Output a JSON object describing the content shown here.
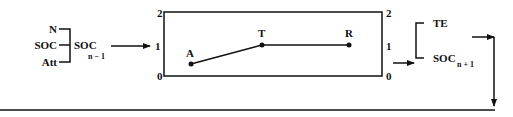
{
  "diagram": {
    "inputs": {
      "items": [
        {
          "label": "N"
        },
        {
          "label": "SOC"
        },
        {
          "label": "Att"
        }
      ],
      "output": {
        "label": "SOC",
        "subscript": "n − 1"
      }
    },
    "chart_box": {
      "left_axis": {
        "ticks": [
          "2",
          "1",
          "0"
        ]
      },
      "right_axis": {
        "ticks": [
          "2",
          "1",
          "0"
        ]
      },
      "points": [
        {
          "label": "A",
          "value": 0.4
        },
        {
          "label": "T",
          "value": 1
        },
        {
          "label": "R",
          "value": 1
        }
      ]
    },
    "outputs": {
      "items": [
        {
          "label": "TE"
        },
        {
          "label": "SOC",
          "subscript": "n + 1"
        }
      ]
    },
    "colors": {
      "stroke": "#111111",
      "background": "#ffffff"
    }
  }
}
